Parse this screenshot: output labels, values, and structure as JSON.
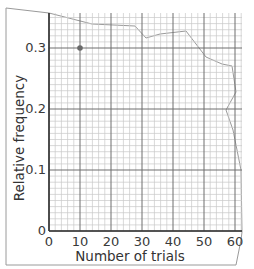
{
  "chart_data": {
    "type": "scatter",
    "title": "",
    "xlabel": "Number of trials",
    "ylabel": "Relative frequency",
    "xlim": [
      0,
      60
    ],
    "ylim": [
      0,
      0.3
    ],
    "x_ticks": [
      "0",
      "10",
      "20",
      "30",
      "40",
      "50",
      "60"
    ],
    "y_ticks": [
      "0",
      "0.1",
      "0.2",
      "0.3"
    ],
    "grid": true,
    "series": [
      {
        "name": "observed",
        "x": [
          10
        ],
        "y": [
          0.3
        ]
      }
    ],
    "legend": null,
    "annotations": []
  },
  "colors": {
    "major_grid": "#6e6e6e",
    "minor_grid": "#c8c8c8",
    "point": "#6a6a6a",
    "paper_edge": "#9a9a9a"
  }
}
